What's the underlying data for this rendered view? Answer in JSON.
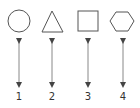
{
  "diagram": {
    "items": [
      {
        "shape": "circle",
        "label": "1"
      },
      {
        "shape": "triangle",
        "label": "2"
      },
      {
        "shape": "square",
        "label": "3"
      },
      {
        "shape": "hexagon",
        "label": "4"
      }
    ],
    "colors": {
      "stroke": "#555555",
      "arrow": "#444444",
      "background": "#ffffff"
    }
  }
}
